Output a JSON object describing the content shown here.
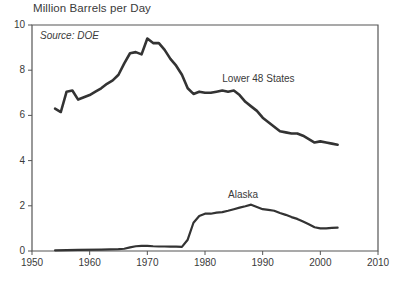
{
  "chart_data": {
    "type": "line",
    "title": "Million Barrels per Day",
    "subtitle": "Source: DOE",
    "xlabel": "",
    "ylabel": "",
    "xlim": [
      1950,
      2010
    ],
    "ylim": [
      0,
      10
    ],
    "xticks": [
      1950,
      1960,
      1970,
      1980,
      1990,
      2000,
      2010
    ],
    "yticks": [
      0,
      2,
      4,
      6,
      8,
      10
    ],
    "xtick_labels": [
      "1950",
      "1960",
      "1970",
      "1980",
      "1990",
      "2000",
      "2010"
    ],
    "ytick_labels": [
      "0",
      "2",
      "4",
      "6",
      "8",
      "10"
    ],
    "grid": false,
    "legend_position": "inline-annotation",
    "line_color": "#333333",
    "axis_color": "#555555",
    "series": [
      {
        "name": "Lower 48 States",
        "label_x": 1983,
        "label_y": 7.55,
        "x": [
          1954,
          1955,
          1956,
          1957,
          1958,
          1959,
          1960,
          1961,
          1962,
          1963,
          1964,
          1965,
          1966,
          1967,
          1968,
          1969,
          1970,
          1971,
          1972,
          1973,
          1974,
          1975,
          1976,
          1977,
          1978,
          1979,
          1980,
          1981,
          1982,
          1983,
          1984,
          1985,
          1986,
          1987,
          1988,
          1989,
          1990,
          1991,
          1992,
          1993,
          1994,
          1995,
          1996,
          1997,
          1998,
          1999,
          2000,
          2001,
          2002,
          2003
        ],
        "values": [
          6.3,
          6.15,
          7.05,
          7.1,
          6.7,
          6.8,
          6.9,
          7.05,
          7.2,
          7.4,
          7.55,
          7.8,
          8.3,
          8.75,
          8.8,
          8.7,
          9.4,
          9.2,
          9.2,
          8.9,
          8.5,
          8.2,
          7.8,
          7.2,
          6.95,
          7.05,
          7.0,
          7.0,
          7.05,
          7.1,
          7.05,
          7.1,
          6.9,
          6.6,
          6.4,
          6.2,
          5.9,
          5.7,
          5.5,
          5.3,
          5.25,
          5.2,
          5.2,
          5.1,
          4.95,
          4.8,
          4.85,
          4.8,
          4.75,
          4.7
        ]
      },
      {
        "name": "Alaska",
        "label_x": 1984,
        "label_y": 2.45,
        "x": [
          1954,
          1958,
          1962,
          1965,
          1966,
          1967,
          1968,
          1969,
          1970,
          1971,
          1972,
          1973,
          1974,
          1975,
          1976,
          1977,
          1978,
          1979,
          1980,
          1981,
          1982,
          1983,
          1984,
          1985,
          1986,
          1987,
          1988,
          1989,
          1990,
          1991,
          1992,
          1993,
          1994,
          1995,
          1996,
          1997,
          1998,
          1999,
          2000,
          2001,
          2002,
          2003
        ],
        "values": [
          0.03,
          0.05,
          0.06,
          0.08,
          0.1,
          0.16,
          0.21,
          0.23,
          0.23,
          0.21,
          0.2,
          0.2,
          0.19,
          0.19,
          0.18,
          0.5,
          1.25,
          1.55,
          1.65,
          1.65,
          1.7,
          1.72,
          1.78,
          1.85,
          1.92,
          1.98,
          2.05,
          1.95,
          1.85,
          1.82,
          1.78,
          1.68,
          1.6,
          1.5,
          1.42,
          1.3,
          1.18,
          1.05,
          1.0,
          1.0,
          1.02,
          1.03
        ]
      }
    ]
  }
}
